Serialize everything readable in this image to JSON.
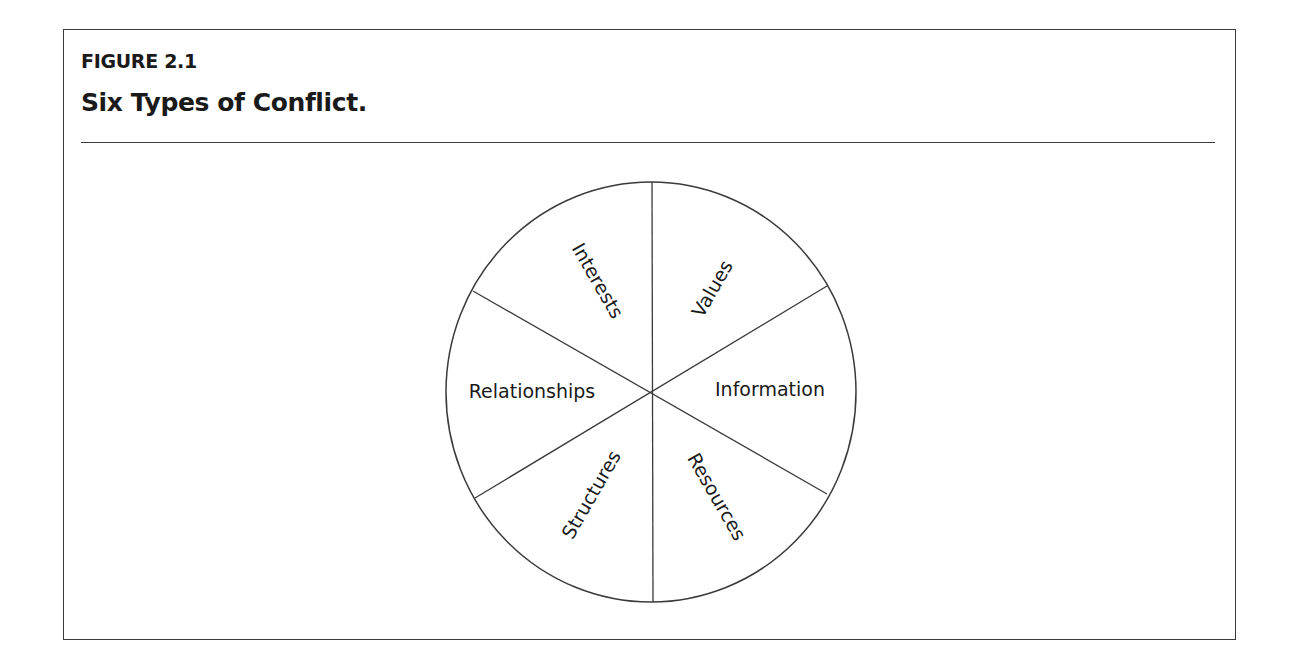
{
  "figure": {
    "label": "FIGURE 2.1",
    "title": "Six Types of Conflict."
  },
  "diagram": {
    "type": "segmented-circle",
    "segments": [
      {
        "label": "Interests",
        "position": "top-left"
      },
      {
        "label": "Values",
        "position": "top-right"
      },
      {
        "label": "Information",
        "position": "right"
      },
      {
        "label": "Resources",
        "position": "bottom-right"
      },
      {
        "label": "Structures",
        "position": "bottom-left"
      },
      {
        "label": "Relationships",
        "position": "left"
      }
    ],
    "line_color": "#3a3a3a",
    "text_color": "#1a1a1a"
  }
}
